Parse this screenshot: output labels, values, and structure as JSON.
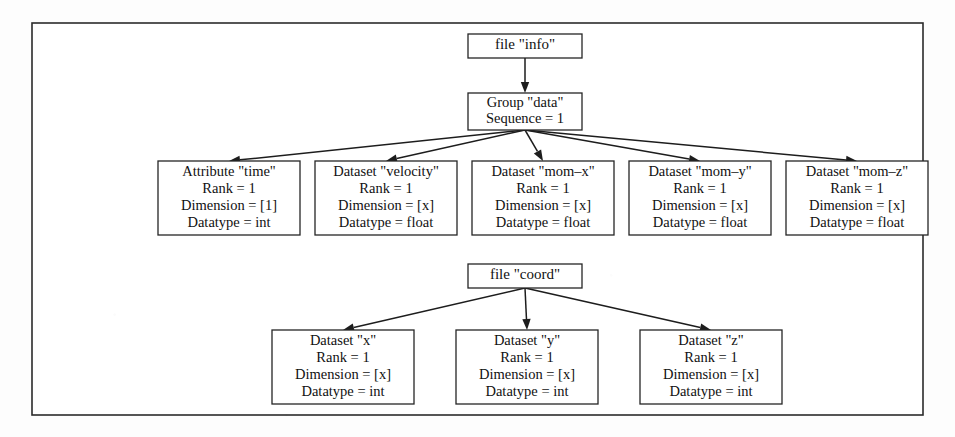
{
  "figure": {
    "background_color": "#fdfdfd",
    "frame_color": "#2b2b2b",
    "node_fill": "#ffffff",
    "node_stroke": "#252525",
    "edge_color": "#1d1d1d"
  },
  "frame": {
    "x": 32,
    "y": 23,
    "width": 891,
    "height": 392
  },
  "nodes": {
    "file_info": {
      "label": "file \"info\"",
      "lines": [
        "file \"info\""
      ],
      "x": 468,
      "y": 34,
      "width": 114,
      "height": 24
    },
    "group_data": {
      "label": "Group \"data\"",
      "lines": [
        "Group \"data\"",
        "Sequence = 1"
      ],
      "x": 468,
      "y": 93,
      "width": 114,
      "height": 37
    },
    "attr_time": {
      "label": "Attribute \"time\"",
      "lines": [
        "Attribute \"time\"",
        "Rank = 1",
        "Dimension = [1]",
        "Datatype = int"
      ],
      "x": 158,
      "y": 161,
      "width": 142,
      "height": 74
    },
    "dataset_velocity": {
      "label": "Dataset \"velocity\"",
      "lines": [
        "Dataset \"velocity\"",
        "Rank = 1",
        "Dimension = [x]",
        "Datatype = float"
      ],
      "x": 315,
      "y": 161,
      "width": 142,
      "height": 74
    },
    "dataset_mom_x": {
      "label": "Dataset \"mom–x\"",
      "lines": [
        "Dataset \"mom–x\"",
        "Rank = 1",
        "Dimension = [x]",
        "Datatype = float"
      ],
      "x": 472,
      "y": 161,
      "width": 142,
      "height": 74
    },
    "dataset_mom_y": {
      "label": "Dataset \"mom–y\"",
      "lines": [
        "Dataset \"mom–y\"",
        "Rank = 1",
        "Dimension = [x]",
        "Datatype = float"
      ],
      "x": 629,
      "y": 161,
      "width": 142,
      "height": 74
    },
    "dataset_mom_z": {
      "label": "Dataset \"mom–z\"",
      "lines": [
        "Dataset \"mom–z\"",
        "Rank = 1",
        "Dimension = [x]",
        "Datatype = float"
      ],
      "x": 786,
      "y": 161,
      "width": 142,
      "height": 74
    },
    "file_coord": {
      "label": "file \"coord\"",
      "lines": [
        "file \"coord\""
      ],
      "x": 468,
      "y": 264,
      "width": 114,
      "height": 24
    },
    "dataset_x": {
      "label": "Dataset \"x\"",
      "lines": [
        "Dataset \"x\"",
        "Rank = 1",
        "Dimension = [x]",
        "Datatype = int"
      ],
      "x": 272,
      "y": 330,
      "width": 142,
      "height": 74
    },
    "dataset_y": {
      "label": "Dataset \"y\"",
      "lines": [
        "Dataset \"y\"",
        "Rank = 1",
        "Dimension = [x]",
        "Datatype = int"
      ],
      "x": 456,
      "y": 330,
      "width": 142,
      "height": 74
    },
    "dataset_z": {
      "label": "Dataset \"z\"",
      "lines": [
        "Dataset \"z\"",
        "Rank = 1",
        "Dimension = [x]",
        "Datatype = int"
      ],
      "x": 640,
      "y": 330,
      "width": 142,
      "height": 74
    }
  },
  "edges": [
    {
      "name": "edge-file-info-to-group-data",
      "from": "file_info",
      "to": "group_data"
    },
    {
      "name": "edge-group-data-to-attr-time",
      "from": "group_data",
      "to": "attr_time"
    },
    {
      "name": "edge-group-data-to-dataset-velocity",
      "from": "group_data",
      "to": "dataset_velocity"
    },
    {
      "name": "edge-group-data-to-dataset-mom-x",
      "from": "group_data",
      "to": "dataset_mom_x"
    },
    {
      "name": "edge-group-data-to-dataset-mom-y",
      "from": "group_data",
      "to": "dataset_mom_y"
    },
    {
      "name": "edge-group-data-to-dataset-mom-z",
      "from": "group_data",
      "to": "dataset_mom_z"
    },
    {
      "name": "edge-file-coord-to-dataset-x",
      "from": "file_coord",
      "to": "dataset_x"
    },
    {
      "name": "edge-file-coord-to-dataset-y",
      "from": "file_coord",
      "to": "dataset_y"
    },
    {
      "name": "edge-file-coord-to-dataset-z",
      "from": "file_coord",
      "to": "dataset_z"
    }
  ]
}
